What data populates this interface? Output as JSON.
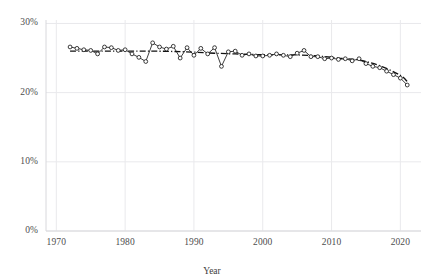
{
  "chart_data": {
    "type": "line",
    "title": "",
    "xlabel": "Year",
    "ylabel": "",
    "xlim": [
      1968.5,
      1923.0
    ],
    "x_axis": {
      "min": 1968.5,
      "max": 2023.0,
      "ticks": [
        1970,
        1980,
        1990,
        2000,
        2010,
        2020
      ],
      "tick_labels": [
        "1970",
        "1980",
        "1990",
        "2000",
        "2010",
        "2020"
      ]
    },
    "y_axis": {
      "min": 0,
      "max": 30.5,
      "ticks": [
        0,
        10,
        20,
        30
      ],
      "tick_labels": [
        "0%",
        "10%",
        "20%",
        "30%"
      ]
    },
    "grid": true,
    "legend": null,
    "series": [
      {
        "name": "observed",
        "style": "solid-line-with-open-circle-markers",
        "color": "#1a1a1a",
        "x": [
          1972,
          1973,
          1974,
          1975,
          1976,
          1977,
          1978,
          1979,
          1980,
          1981,
          1982,
          1983,
          1984,
          1985,
          1986,
          1987,
          1988,
          1989,
          1990,
          1991,
          1992,
          1993,
          1994,
          1995,
          1996,
          1997,
          1998,
          1999,
          2000,
          2001,
          2002,
          2003,
          2004,
          2005,
          2006,
          2007,
          2008,
          2009,
          2010,
          2011,
          2012,
          2013,
          2014,
          2015,
          2016,
          2017,
          2018,
          2019,
          2020,
          2021
        ],
        "values": [
          26.6,
          26.4,
          26.2,
          26.1,
          25.6,
          26.6,
          26.5,
          26.1,
          26.2,
          25.6,
          25.1,
          24.5,
          27.2,
          26.6,
          26.3,
          26.7,
          25.0,
          26.5,
          25.4,
          26.4,
          25.6,
          26.5,
          23.8,
          25.9,
          26.0,
          25.4,
          25.6,
          25.3,
          25.3,
          25.4,
          25.6,
          25.4,
          25.2,
          25.7,
          26.1,
          25.2,
          25.2,
          24.9,
          25.0,
          24.8,
          24.9,
          24.6,
          24.9,
          24.2,
          23.8,
          23.6,
          23.1,
          22.6,
          22.1,
          21.1
        ]
      },
      {
        "name": "trend",
        "style": "dash-dot-smoothed-trend",
        "color": "#111111",
        "x": [
          1972,
          1975,
          1978,
          1981,
          1984,
          1987,
          1990,
          1993,
          1996,
          1999,
          2002,
          2005,
          2008,
          2011,
          2014,
          2017,
          2020,
          2021
        ],
        "values": [
          26.0,
          26.0,
          26.0,
          26.0,
          26.0,
          25.95,
          25.85,
          25.7,
          25.6,
          25.5,
          25.45,
          25.45,
          25.3,
          25.0,
          24.7,
          23.9,
          22.5,
          21.6
        ]
      }
    ]
  },
  "axis_style": {
    "grid_color": "#e9e9ec",
    "axis_line_color": "#d8d8dc",
    "tick_text_color": "#4d4d4d",
    "background": "#ffffff"
  }
}
